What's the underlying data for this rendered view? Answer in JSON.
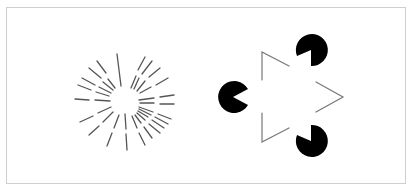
{
  "figure": {
    "colors": {
      "background": "#ffffff",
      "frame_border": "#cfcfcf",
      "line_stroke": "#555555",
      "pacman_fill": "#000000",
      "triangle_stroke": "#777777"
    },
    "panels": [
      {
        "id": "ehrenstein",
        "label": "Ehrenstein illusion (radial line segments with illusory central disc)",
        "center": [
          124,
          100
        ],
        "inner_gap_radius": 13,
        "outer_radius": 48
      },
      {
        "id": "kanizsa",
        "label": "Kanizsa triangle (illusory triangle from three pac-man inducers)",
        "inducers": [
          {
            "cx": 311,
            "cy": 50,
            "r": 16
          },
          {
            "cx": 233,
            "cy": 97,
            "r": 16
          },
          {
            "cx": 311,
            "cy": 141,
            "r": 16
          }
        ]
      }
    ]
  }
}
